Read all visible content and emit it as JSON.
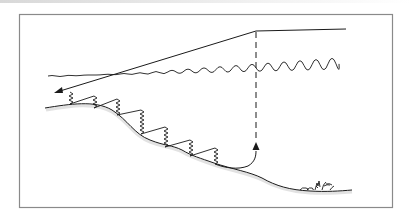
{
  "diagram": {
    "colors": {
      "frame": "#8a8a8a",
      "ink": "#1a1a1a",
      "seabed_shadow": "#c8c8c8",
      "background": "#ffffff"
    },
    "elements": [
      {
        "id": "frame",
        "type": "rectangle"
      },
      {
        "id": "surface-line",
        "type": "wavy-line",
        "label": "water surface"
      },
      {
        "id": "source-line",
        "type": "polyline",
        "label": "transmission path from vessel"
      },
      {
        "id": "incident-arrow",
        "type": "arrow",
        "direction": "down-left"
      },
      {
        "id": "zigzag-path",
        "type": "zigzag",
        "label": "sound path along seabed slope"
      },
      {
        "id": "return-curve",
        "type": "curve-arrow",
        "direction": "up"
      },
      {
        "id": "return-dashed-line",
        "type": "dashed-line",
        "label": "vertical return path"
      },
      {
        "id": "seabed",
        "type": "curve",
        "label": "sea floor slope"
      },
      {
        "id": "seaweed",
        "type": "decoration",
        "label": "rocks and vegetation on sea floor"
      }
    ],
    "text_labels": []
  }
}
